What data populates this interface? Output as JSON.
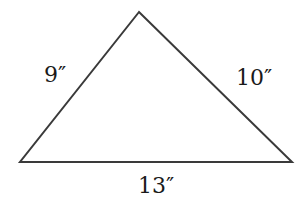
{
  "diagram": {
    "type": "triangle",
    "stroke_color": "#3a3a3a",
    "stroke_width": 2,
    "vertices": {
      "apex": [
        139,
        12
      ],
      "bottom_left": [
        20,
        162
      ],
      "bottom_right": [
        292,
        162
      ]
    },
    "sides": {
      "left": {
        "label": "9″",
        "length": 9,
        "unit": "inches"
      },
      "right": {
        "label": "10″",
        "length": 10,
        "unit": "inches"
      },
      "bottom": {
        "label": "13″",
        "length": 13,
        "unit": "inches"
      }
    }
  }
}
